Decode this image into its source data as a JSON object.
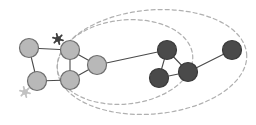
{
  "figure": {
    "type": "graph-diagram",
    "width": 256,
    "height": 125,
    "background_color": "#ffffff",
    "title": "",
    "caption": ""
  },
  "style": {
    "light_node_fill": "#b8b8b8",
    "light_node_stroke": "#6e6e6e",
    "dark_node_fill": "#4a4a4a",
    "dark_node_stroke": "#3a3a3a",
    "edge_color": "#4a4a4a",
    "edge_width": 1.1,
    "node_radius": 9.5,
    "node_stroke_width": 1.2,
    "dashed_color": "#b0b0b0",
    "dashed_width": 1.2,
    "dash_pattern": "4,3",
    "star_dark_color": "#3f3f3f",
    "star_light_color": "#c2c2c2"
  },
  "clusters": [
    {
      "id": "cluster-inner",
      "label": "inner-dashed-boundary",
      "shape": "ellipse",
      "cx": 125,
      "cy": 62,
      "rx": 68,
      "ry": 42,
      "rotation": -6,
      "color": "#b0b0b0"
    },
    {
      "id": "cluster-outer",
      "label": "outer-dashed-boundary",
      "shape": "ellipse",
      "cx": 152,
      "cy": 62,
      "rx": 95,
      "ry": 52,
      "rotation": -5,
      "color": "#b0b0b0"
    }
  ],
  "nodes": [
    {
      "id": "n1",
      "label": "",
      "x": 29,
      "y": 48,
      "group": "light",
      "fill": "#b8b8b8",
      "stroke": "#6e6e6e",
      "r": 9.5
    },
    {
      "id": "n2",
      "label": "",
      "x": 37,
      "y": 81,
      "group": "light",
      "fill": "#b8b8b8",
      "stroke": "#6e6e6e",
      "r": 9.5
    },
    {
      "id": "n3",
      "label": "",
      "x": 70,
      "y": 50,
      "group": "light",
      "fill": "#b8b8b8",
      "stroke": "#6e6e6e",
      "r": 9.5
    },
    {
      "id": "n4",
      "label": "",
      "x": 70,
      "y": 80,
      "group": "light",
      "fill": "#b8b8b8",
      "stroke": "#6e6e6e",
      "r": 9.5
    },
    {
      "id": "n5",
      "label": "",
      "x": 97,
      "y": 65,
      "group": "light",
      "fill": "#b8b8b8",
      "stroke": "#6e6e6e",
      "r": 9.5
    },
    {
      "id": "n6",
      "label": "",
      "x": 167,
      "y": 50,
      "group": "dark",
      "fill": "#4a4a4a",
      "stroke": "#3a3a3a",
      "r": 9.5
    },
    {
      "id": "n7",
      "label": "",
      "x": 159,
      "y": 78,
      "group": "dark",
      "fill": "#4a4a4a",
      "stroke": "#3a3a3a",
      "r": 9.5
    },
    {
      "id": "n8",
      "label": "",
      "x": 188,
      "y": 72,
      "group": "dark",
      "fill": "#4a4a4a",
      "stroke": "#3a3a3a",
      "r": 9.5
    },
    {
      "id": "n9",
      "label": "",
      "x": 232,
      "y": 50,
      "group": "dark",
      "fill": "#4a4a4a",
      "stroke": "#3a3a3a",
      "r": 9.5
    }
  ],
  "edges": [
    {
      "source": "n1",
      "target": "n3"
    },
    {
      "source": "n1",
      "target": "n2"
    },
    {
      "source": "n2",
      "target": "n4"
    },
    {
      "source": "n3",
      "target": "n4"
    },
    {
      "source": "n3",
      "target": "n5"
    },
    {
      "source": "n4",
      "target": "n5"
    },
    {
      "source": "n5",
      "target": "n6"
    },
    {
      "source": "n6",
      "target": "n7"
    },
    {
      "source": "n6",
      "target": "n8"
    },
    {
      "source": "n7",
      "target": "n8"
    },
    {
      "source": "n8",
      "target": "n9"
    }
  ],
  "markers": [
    {
      "id": "m1",
      "label": "dark-star-marker",
      "x": 58,
      "y": 39,
      "color": "#3f3f3f",
      "size": 5.2
    },
    {
      "id": "m2",
      "label": "light-star-marker",
      "x": 25,
      "y": 92,
      "color": "#c2c2c2",
      "size": 5.2
    }
  ]
}
